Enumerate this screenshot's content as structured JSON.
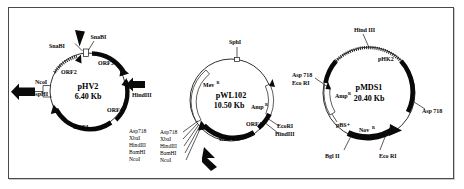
{
  "figure": {
    "border_color": "#4a4a4a",
    "background": "#ffffff",
    "ink_color": "#0a0a0a"
  },
  "plasmids": [
    {
      "id": "phv2",
      "name": "pHV2",
      "size": "6.40 Kb",
      "features": [
        {
          "label": "ORF1"
        },
        {
          "label": "ORF2"
        },
        {
          "label": "ORF3"
        },
        {
          "label": "ORF4"
        }
      ],
      "sites": [
        {
          "label": "SnaBI"
        },
        {
          "label": "SnaBI"
        },
        {
          "label": "NcoI"
        },
        {
          "label": "BspHI"
        },
        {
          "label": "HindIII"
        }
      ],
      "site_list": [
        "Asp718",
        "XbaI",
        "HindIII",
        "BamHI",
        "NcoI"
      ]
    },
    {
      "id": "pwl102",
      "name": "pWL102",
      "size": "10.50 Kb",
      "features": [
        {
          "label": "Mev",
          "sup": "R"
        },
        {
          "label": "Amp",
          "sup": "R"
        },
        {
          "label": "ORF1"
        },
        {
          "label": "ORF4"
        }
      ],
      "sites": [
        {
          "label": "SphI"
        },
        {
          "label": "EcoRI"
        },
        {
          "label": "HindIII"
        }
      ],
      "site_list": [
        "Asp718",
        "XbaI",
        "HindIII",
        "BamHI",
        "NcoI"
      ]
    },
    {
      "id": "pmds1",
      "name": "pMDS1",
      "size": "20.40 Kb",
      "features": [
        {
          "label": "pHK2"
        },
        {
          "label": "Amp",
          "sup": "R"
        },
        {
          "label": "pBS+"
        },
        {
          "label": "Nov",
          "sup": "R"
        }
      ],
      "sites": [
        {
          "label": "Hind III"
        },
        {
          "label": "Asp 718"
        },
        {
          "label": "Eco RI"
        },
        {
          "label": "Asp 718"
        },
        {
          "label": "Eco RI"
        },
        {
          "label": "Bgl II"
        }
      ]
    }
  ]
}
